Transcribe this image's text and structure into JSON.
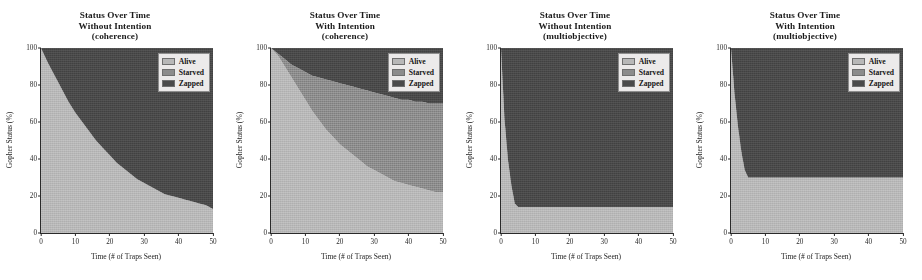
{
  "figure": {
    "background": "#ffffff",
    "width": 922,
    "height": 280
  },
  "colors": {
    "alive": "#b8b8b8",
    "starved": "#8c8c8c",
    "zapped": "#4a4a4a",
    "axis": "#2a2a2a",
    "legend_bg": "#eceaea",
    "legend_border": "#8e8e8e"
  },
  "legend": {
    "entries": [
      {
        "label": "Alive",
        "color": "#b8b8b8"
      },
      {
        "label": "Starved",
        "color": "#8c8c8c"
      },
      {
        "label": "Zapped",
        "color": "#4a4a4a"
      }
    ]
  },
  "axis_common": {
    "xlabel": "Time (# of Traps Seen)",
    "ylabel": "Gopher Status (%)",
    "xticks": [
      0,
      10,
      20,
      30,
      40,
      50
    ],
    "yticks": [
      0,
      20,
      40,
      60,
      80,
      100
    ],
    "xlim": [
      0,
      50
    ],
    "ylim": [
      0,
      100
    ],
    "grid": false
  },
  "chart_data": [
    {
      "type": "area",
      "panel_index": 0,
      "title": [
        "Status Over Time",
        "Without Intention",
        "(coherence)"
      ],
      "xlabel": "Time (# of Traps Seen)",
      "ylabel": "Gopher Status (%)",
      "xlim": [
        0,
        50
      ],
      "ylim": [
        0,
        100
      ],
      "xticks": [
        0,
        10,
        20,
        30,
        40,
        50
      ],
      "yticks": [
        0,
        20,
        40,
        60,
        80,
        100
      ],
      "grid": false,
      "legend_position": "upper right",
      "stacked": true,
      "x": [
        0,
        2,
        4,
        6,
        8,
        10,
        12,
        14,
        16,
        18,
        20,
        22,
        24,
        26,
        28,
        30,
        32,
        34,
        36,
        38,
        40,
        42,
        44,
        46,
        48,
        50
      ],
      "series": [
        {
          "name": "Alive",
          "color": "#b8b8b8",
          "values": [
            100,
            92,
            85,
            78,
            71,
            65,
            60,
            55,
            50,
            46,
            42,
            38,
            35,
            32,
            29,
            27,
            25,
            23,
            21,
            20,
            19,
            18,
            17,
            16,
            15,
            13
          ]
        },
        {
          "name": "Starved",
          "color": "#8c8c8c",
          "values": [
            0,
            0,
            0,
            0,
            0,
            0,
            0,
            0,
            0,
            0,
            0,
            0,
            0,
            0,
            0,
            0,
            0,
            0,
            0,
            0,
            0,
            0,
            0,
            0,
            0,
            0
          ]
        },
        {
          "name": "Zapped",
          "color": "#4a4a4a",
          "values": [
            0,
            8,
            15,
            22,
            29,
            35,
            40,
            45,
            50,
            54,
            58,
            62,
            65,
            68,
            71,
            73,
            75,
            77,
            79,
            80,
            81,
            82,
            83,
            84,
            85,
            87
          ]
        }
      ]
    },
    {
      "type": "area",
      "panel_index": 1,
      "title": [
        "Status Over Time",
        "With Intention",
        "(coherence)"
      ],
      "xlabel": "Time (# of Traps Seen)",
      "ylabel": "Gopher Status (%)",
      "xlim": [
        0,
        50
      ],
      "ylim": [
        0,
        100
      ],
      "xticks": [
        0,
        10,
        20,
        30,
        40,
        50
      ],
      "yticks": [
        0,
        20,
        40,
        60,
        80,
        100
      ],
      "grid": false,
      "legend_position": "upper right",
      "stacked": true,
      "x": [
        0,
        2,
        4,
        6,
        8,
        10,
        12,
        14,
        16,
        18,
        20,
        22,
        24,
        26,
        28,
        30,
        32,
        34,
        36,
        38,
        40,
        42,
        44,
        46,
        48,
        50
      ],
      "series": [
        {
          "name": "Alive",
          "color": "#b8b8b8",
          "values": [
            100,
            96,
            90,
            84,
            78,
            72,
            66,
            61,
            56,
            52,
            48,
            45,
            42,
            39,
            36,
            34,
            32,
            30,
            28,
            27,
            26,
            25,
            24,
            23,
            22,
            22
          ]
        },
        {
          "name": "Starved",
          "color": "#8c8c8c",
          "values": [
            0,
            1,
            4,
            7,
            11,
            15,
            19,
            23,
            27,
            30,
            33,
            35,
            37,
            39,
            41,
            42,
            43,
            44,
            45,
            45,
            46,
            46,
            47,
            47,
            48,
            48
          ]
        },
        {
          "name": "Zapped",
          "color": "#4a4a4a",
          "values": [
            0,
            3,
            6,
            9,
            11,
            13,
            15,
            16,
            17,
            18,
            19,
            20,
            21,
            22,
            23,
            24,
            25,
            26,
            27,
            28,
            28,
            29,
            29,
            30,
            30,
            30
          ]
        }
      ]
    },
    {
      "type": "area",
      "panel_index": 2,
      "title": [
        "Status Over Time",
        "Without Intention",
        "(multiobjective)"
      ],
      "xlabel": "Time (# of Traps Seen)",
      "ylabel": "Gopher Status (%)",
      "xlim": [
        0,
        50
      ],
      "ylim": [
        0,
        100
      ],
      "xticks": [
        0,
        10,
        20,
        30,
        40,
        50
      ],
      "yticks": [
        0,
        20,
        40,
        60,
        80,
        100
      ],
      "grid": false,
      "legend_position": "upper right",
      "stacked": true,
      "x": [
        0,
        1,
        2,
        3,
        4,
        5,
        10,
        20,
        30,
        40,
        50
      ],
      "series": [
        {
          "name": "Alive",
          "color": "#b8b8b8",
          "values": [
            100,
            62,
            40,
            26,
            16,
            14,
            14,
            14,
            14,
            14,
            14
          ]
        },
        {
          "name": "Starved",
          "color": "#8c8c8c",
          "values": [
            0,
            0,
            0,
            0,
            0,
            0,
            0,
            0,
            0,
            0,
            0
          ]
        },
        {
          "name": "Zapped",
          "color": "#4a4a4a",
          "values": [
            0,
            38,
            60,
            74,
            84,
            86,
            86,
            86,
            86,
            86,
            86
          ]
        }
      ]
    },
    {
      "type": "area",
      "panel_index": 3,
      "title": [
        "Status Over Time",
        "With Intention",
        "(multiobjective)"
      ],
      "xlabel": "Time (# of Traps Seen)",
      "ylabel": "Gopher Status (%)",
      "xlim": [
        0,
        50
      ],
      "ylim": [
        0,
        100
      ],
      "xticks": [
        0,
        10,
        20,
        30,
        40,
        50
      ],
      "yticks": [
        0,
        20,
        40,
        60,
        80,
        100
      ],
      "grid": false,
      "legend_position": "upper right",
      "stacked": true,
      "x": [
        0,
        1,
        2,
        3,
        4,
        5,
        10,
        20,
        30,
        40,
        50
      ],
      "series": [
        {
          "name": "Alive",
          "color": "#b8b8b8",
          "values": [
            100,
            76,
            58,
            44,
            34,
            30,
            30,
            30,
            30,
            30,
            30
          ]
        },
        {
          "name": "Starved",
          "color": "#8c8c8c",
          "values": [
            0,
            0,
            0,
            0,
            0,
            0,
            0,
            0,
            0,
            0,
            0
          ]
        },
        {
          "name": "Zapped",
          "color": "#4a4a4a",
          "values": [
            0,
            24,
            42,
            56,
            66,
            70,
            70,
            70,
            70,
            70,
            70
          ]
        }
      ]
    }
  ]
}
